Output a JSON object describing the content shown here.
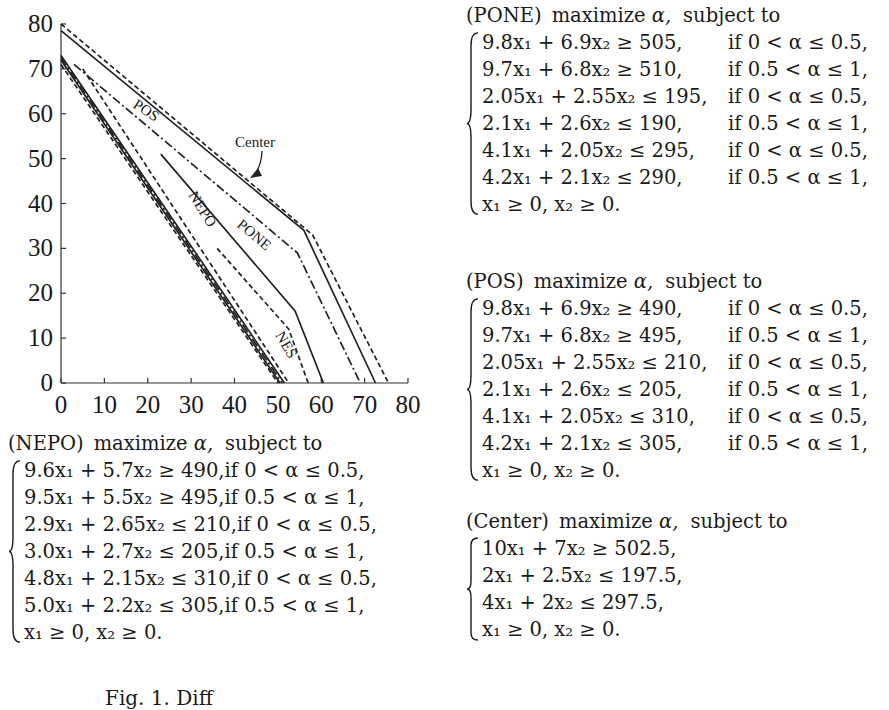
{
  "chart_data": {
    "type": "line",
    "title": "",
    "xlabel": "",
    "ylabel": "",
    "xlim": [
      0,
      80
    ],
    "ylim": [
      0,
      80
    ],
    "x_ticks": [
      0,
      10,
      20,
      30,
      40,
      50,
      60,
      70,
      80
    ],
    "y_ticks": [
      0,
      10,
      20,
      30,
      40,
      50,
      60,
      70,
      80
    ],
    "grid": false,
    "legend": "inline labels",
    "annotations": [
      "POS",
      "Center",
      "PONE",
      "NEPO",
      "NES"
    ],
    "series": [
      {
        "name": "Center (solid)",
        "style": "solid",
        "points": [
          [
            0,
            78.5
          ],
          [
            56,
            34
          ],
          [
            72.5,
            0
          ]
        ]
      },
      {
        "name": "Center (dashed)",
        "style": "dashed",
        "points": [
          [
            0,
            80
          ],
          [
            58,
            33
          ],
          [
            75.5,
            0
          ]
        ]
      },
      {
        "name": "POS",
        "style": "dash-dot",
        "points": [
          [
            3,
            71
          ],
          [
            54.5,
            29
          ],
          [
            69,
            0
          ]
        ]
      },
      {
        "name": "PONE",
        "style": "solid",
        "points": [
          [
            23,
            51
          ],
          [
            54,
            16
          ],
          [
            60.5,
            0
          ]
        ]
      },
      {
        "name": "NES",
        "style": "dashed",
        "points": [
          [
            36,
            30
          ],
          [
            52.5,
            12
          ],
          [
            57,
            0
          ]
        ]
      },
      {
        "name": "NEPO (solid 1)",
        "style": "solid",
        "points": [
          [
            0,
            73
          ],
          [
            51.5,
            0
          ]
        ]
      },
      {
        "name": "NEPO (solid 2)",
        "style": "solid",
        "points": [
          [
            0,
            72
          ],
          [
            50.5,
            0
          ]
        ]
      },
      {
        "name": "NEPO (dashed 1)",
        "style": "dashed",
        "points": [
          [
            0,
            71
          ],
          [
            50,
            0
          ]
        ]
      },
      {
        "name": "NEPO (dashed 2)",
        "style": "dashed",
        "points": [
          [
            5,
            70
          ],
          [
            52.5,
            0
          ]
        ]
      },
      {
        "name": "NEPO (dash-dot)",
        "style": "dash-dot",
        "points": [
          [
            0,
            72.5
          ],
          [
            51,
            0
          ]
        ]
      }
    ]
  },
  "chart": {
    "x_tick_labels": [
      "0",
      "10",
      "20",
      "30",
      "40",
      "50",
      "60",
      "70",
      "80"
    ],
    "y_tick_labels": [
      "0",
      "10",
      "20",
      "30",
      "40",
      "50",
      "60",
      "70",
      "80"
    ],
    "labels": {
      "pos": "POS",
      "center": "Center",
      "pone": "PONE",
      "nepo": "NEPO",
      "nes": "NES"
    }
  },
  "models": {
    "nepo": {
      "name": "(NEPO)",
      "objective": "maximize",
      "var": "α,",
      "subject": "subject to",
      "rows": [
        {
          "eq": "9.6x₁ + 5.7x₂ ≥ 490,",
          "cond": "if 0 < α ≤ 0.5,"
        },
        {
          "eq": "9.5x₁ + 5.5x₂ ≥ 495,",
          "cond": "if 0.5 < α ≤ 1,"
        },
        {
          "eq": "2.9x₁ + 2.65x₂ ≤ 210,",
          "cond": "if 0 < α ≤ 0.5,"
        },
        {
          "eq": "3.0x₁ + 2.7x₂ ≤ 205,",
          "cond": "if 0.5 < α ≤ 1,"
        },
        {
          "eq": "4.8x₁ + 2.15x₂ ≤ 310,",
          "cond": "if 0 < α ≤ 0.5,"
        },
        {
          "eq": "5.0x₁ + 2.2x₂ ≤ 305,",
          "cond": "if 0.5 < α ≤ 1,"
        },
        {
          "eq": "x₁ ≥ 0,  x₂ ≥ 0.",
          "cond": ""
        }
      ]
    },
    "pone": {
      "name": "(PONE)",
      "objective": "maximize",
      "var": "α,",
      "subject": "subject to",
      "rows": [
        {
          "eq": "9.8x₁ + 6.9x₂ ≥ 505,",
          "cond": "if 0 < α ≤ 0.5,"
        },
        {
          "eq": "9.7x₁ + 6.8x₂ ≥ 510,",
          "cond": "if 0.5 < α ≤ 1,"
        },
        {
          "eq": "2.05x₁ + 2.55x₂ ≤ 195,",
          "cond": "if 0 < α ≤ 0.5,"
        },
        {
          "eq": "2.1x₁ + 2.6x₂ ≤ 190,",
          "cond": "if 0.5 < α ≤ 1,"
        },
        {
          "eq": "4.1x₁ + 2.05x₂ ≤ 295,",
          "cond": "if 0 < α ≤ 0.5,"
        },
        {
          "eq": "4.2x₁ + 2.1x₂ ≤ 290,",
          "cond": "if 0.5 < α ≤ 1,"
        },
        {
          "eq": "x₁ ≥ 0,  x₂ ≥ 0.",
          "cond": ""
        }
      ]
    },
    "pos": {
      "name": "(POS)",
      "objective": "maximize",
      "var": "α,",
      "subject": "subject to",
      "rows": [
        {
          "eq": "9.8x₁ + 6.9x₂ ≥ 490,",
          "cond": "if 0 < α ≤ 0.5,"
        },
        {
          "eq": "9.7x₁ + 6.8x₂ ≥ 495,",
          "cond": "if 0.5 < α ≤ 1,"
        },
        {
          "eq": "2.05x₁ + 2.55x₂ ≤ 210,",
          "cond": "if 0 < α ≤ 0.5,"
        },
        {
          "eq": "2.1x₁ + 2.6x₂ ≤ 205,",
          "cond": "if 0.5 < α ≤ 1,"
        },
        {
          "eq": "4.1x₁ + 2.05x₂ ≤ 310,",
          "cond": "if 0 < α ≤ 0.5,"
        },
        {
          "eq": "4.2x₁ + 2.1x₂ ≤ 305,",
          "cond": "if 0.5 < α ≤ 1,"
        },
        {
          "eq": "x₁ ≥ 0,  x₂ ≥ 0.",
          "cond": ""
        }
      ]
    },
    "center": {
      "name": "(Center)",
      "objective": "maximize",
      "var": "α,",
      "subject": "subject to",
      "rows": [
        {
          "eq": "10x₁ + 7x₂ ≥ 502.5,",
          "cond": ""
        },
        {
          "eq": "2x₁ + 2.5x₂ ≤ 197.5,",
          "cond": ""
        },
        {
          "eq": "4x₁ + 2x₂ ≤ 297.5,",
          "cond": ""
        },
        {
          "eq": "x₁ ≥ 0,  x₂ ≥ 0.",
          "cond": ""
        }
      ]
    }
  },
  "caption": "Fig. 1. Diff"
}
